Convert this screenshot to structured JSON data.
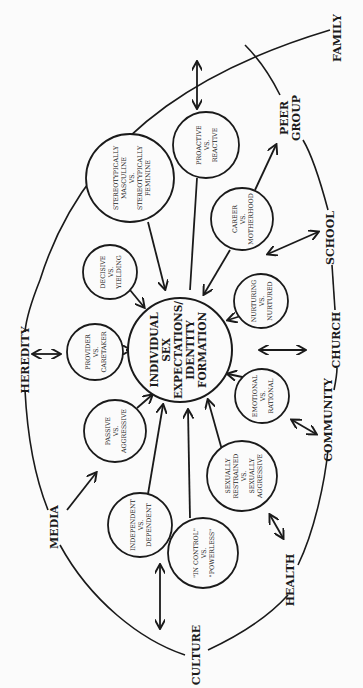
{
  "diagram": {
    "center": {
      "lines": [
        "INDIVIDUAL",
        "SEX",
        "EXPECTATIONS/",
        "IDENTITY",
        "FORMATION"
      ]
    },
    "outer_influences": [
      {
        "id": "family",
        "label": "FAMILY"
      },
      {
        "id": "peer-group",
        "label": "PEER GROUP",
        "lines": [
          "PEER",
          "GROUP"
        ]
      },
      {
        "id": "school",
        "label": "SCHOOL"
      },
      {
        "id": "church",
        "label": "CHURCH"
      },
      {
        "id": "community",
        "label": "COMMUNITY"
      },
      {
        "id": "health",
        "label": "HEALTH"
      },
      {
        "id": "culture",
        "label": "CULTURE"
      },
      {
        "id": "media",
        "label": "MEDIA"
      },
      {
        "id": "heredity",
        "label": "HEREDITY"
      }
    ],
    "dichotomies": [
      {
        "id": "proactive-reactive",
        "lines": [
          "PROACTIVE",
          "VS.",
          "REACTIVE"
        ]
      },
      {
        "id": "stereotypical",
        "lines": [
          "STEREOTYPICALLY",
          "MASCULINE",
          "VS.",
          "STEREOTYPICALLY",
          "FEMININE"
        ]
      },
      {
        "id": "decisive-yielding",
        "lines": [
          "DECISIVE",
          "VS.",
          "YIELDING"
        ]
      },
      {
        "id": "provider-caretaker",
        "lines": [
          "PROVIDER",
          "VS.",
          "CARETAKER"
        ]
      },
      {
        "id": "passive-aggressive",
        "lines": [
          "PASSIVE",
          "VS.",
          "AGGRESSIVE"
        ]
      },
      {
        "id": "independent-dependent",
        "lines": [
          "INDEPENDENT",
          "VS.",
          "DEPENDENT"
        ]
      },
      {
        "id": "in-control-powerless",
        "lines": [
          "\"IN CONTROL\"",
          "VS.",
          "\"POWERLESS\""
        ]
      },
      {
        "id": "sexually-restrained-aggressive",
        "lines": [
          "SEXUALLY",
          "RESTRAINED",
          "VS.",
          "SEXUALLY",
          "AGGRESSIVE"
        ]
      },
      {
        "id": "emotional-rational",
        "lines": [
          "EMOTIONAL",
          "VS.",
          "RATIONAL"
        ]
      },
      {
        "id": "nurturing-nurtured",
        "lines": [
          "NURTURING",
          "VS.",
          "NURTURED"
        ]
      },
      {
        "id": "career-motherhood",
        "lines": [
          "CAREER",
          "VS.",
          "MOTHERHOOD"
        ]
      }
    ]
  }
}
